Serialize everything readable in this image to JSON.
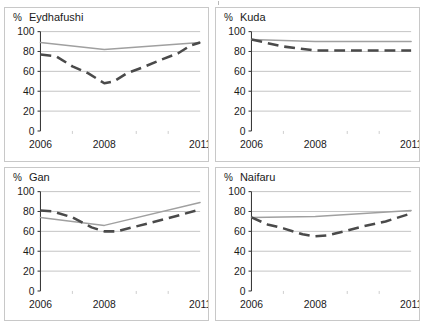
{
  "figure": {
    "layout": "2x2 small multiples",
    "panel_order": [
      "eydhafushi",
      "kuda",
      "gan",
      "naifaru"
    ]
  },
  "axis": {
    "percent_symbol": "%",
    "y_ticks": [
      "0",
      "20",
      "40",
      "60",
      "80",
      "100"
    ],
    "x_ticks": [
      "2006",
      "2008",
      "2011"
    ]
  },
  "chart_data": [
    {
      "type": "line",
      "title": "Eydhafushi",
      "xlabel": "",
      "ylabel": "%",
      "ylim": [
        0,
        100
      ],
      "xlim": [
        2006,
        2011
      ],
      "grid": true,
      "legend": "none",
      "ytick_values": [
        0,
        20,
        40,
        60,
        80,
        100
      ],
      "xtick_values": [
        2006,
        2008,
        2011
      ],
      "series": [
        {
          "name": "solid-gray",
          "style": "solid",
          "color": "#a0a0a0",
          "x": [
            2006,
            2008,
            2011
          ],
          "values": [
            89,
            82,
            89
          ]
        },
        {
          "name": "dashed-dark",
          "style": "dashed",
          "color": "#4a4a4a",
          "x": [
            2006,
            2006.5,
            2007,
            2007.5,
            2008,
            2008.3,
            2008.7,
            2009.2,
            2009.8,
            2010.3,
            2010.7,
            2011
          ],
          "values": [
            77,
            75,
            65,
            58,
            48,
            50,
            58,
            64,
            72,
            78,
            86,
            89
          ]
        }
      ]
    },
    {
      "type": "line",
      "title": "Kuda",
      "xlabel": "",
      "ylabel": "%",
      "ylim": [
        0,
        100
      ],
      "xlim": [
        2006,
        2011
      ],
      "grid": true,
      "legend": "none",
      "ytick_values": [
        0,
        20,
        40,
        60,
        80,
        100
      ],
      "xtick_values": [
        2006,
        2008,
        2011
      ],
      "series": [
        {
          "name": "solid-gray",
          "style": "solid",
          "color": "#a0a0a0",
          "x": [
            2006,
            2008,
            2011
          ],
          "values": [
            92,
            90,
            90
          ]
        },
        {
          "name": "dashed-dark",
          "style": "dashed",
          "color": "#4a4a4a",
          "x": [
            2006,
            2007,
            2008,
            2009.5,
            2011
          ],
          "values": [
            92,
            85,
            81,
            81,
            81
          ]
        }
      ]
    },
    {
      "type": "line",
      "title": "Gan",
      "xlabel": "",
      "ylabel": "%",
      "ylim": [
        0,
        100
      ],
      "xlim": [
        2006,
        2011
      ],
      "grid": true,
      "legend": "none",
      "ytick_values": [
        0,
        20,
        40,
        60,
        80,
        100
      ],
      "xtick_values": [
        2006,
        2008,
        2011
      ],
      "series": [
        {
          "name": "solid-gray",
          "style": "solid",
          "color": "#a0a0a0",
          "x": [
            2006,
            2007,
            2008,
            2011
          ],
          "values": [
            74,
            70,
            66,
            89
          ]
        },
        {
          "name": "dashed-dark",
          "style": "dashed",
          "color": "#4a4a4a",
          "x": [
            2006,
            2006.4,
            2007,
            2007.6,
            2008,
            2008.4,
            2009,
            2009.6,
            2010.2,
            2011
          ],
          "values": [
            81,
            80,
            74,
            64,
            60,
            60,
            65,
            70,
            75,
            82
          ]
        }
      ]
    },
    {
      "type": "line",
      "title": "Naifaru",
      "xlabel": "",
      "ylabel": "%",
      "ylim": [
        0,
        100
      ],
      "xlim": [
        2006,
        2011
      ],
      "grid": true,
      "legend": "none",
      "ytick_values": [
        0,
        20,
        40,
        60,
        80,
        100
      ],
      "xtick_values": [
        2006,
        2008,
        2011
      ],
      "series": [
        {
          "name": "solid-gray",
          "style": "solid",
          "color": "#a0a0a0",
          "x": [
            2006,
            2008,
            2011
          ],
          "values": [
            74,
            75,
            81
          ]
        },
        {
          "name": "dashed-dark",
          "style": "dashed",
          "color": "#4a4a4a",
          "x": [
            2006,
            2006.5,
            2007,
            2007.6,
            2008,
            2008.4,
            2008.9,
            2009.5,
            2010.2,
            2011
          ],
          "values": [
            74,
            67,
            63,
            57,
            55,
            56,
            60,
            65,
            70,
            78
          ]
        }
      ]
    }
  ]
}
